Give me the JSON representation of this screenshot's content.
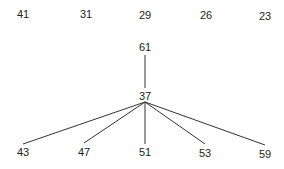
{
  "top_row": [
    {
      "label": "41",
      "x": 23,
      "y": 14
    },
    {
      "label": "31",
      "x": 86,
      "y": 14
    },
    {
      "label": "29",
      "x": 145,
      "y": 15
    },
    {
      "label": "26",
      "x": 206,
      "y": 15
    },
    {
      "label": "23",
      "x": 265,
      "y": 16
    }
  ],
  "tree": {
    "root": {
      "label": "61",
      "x": 145,
      "y": 47
    },
    "middle": {
      "label": "37",
      "x": 145,
      "y": 96
    },
    "children": [
      {
        "label": "43",
        "x": 23,
        "y": 152
      },
      {
        "label": "47",
        "x": 84,
        "y": 152
      },
      {
        "label": "51",
        "x": 145,
        "y": 152
      },
      {
        "label": "53",
        "x": 205,
        "y": 153
      },
      {
        "label": "59",
        "x": 265,
        "y": 154
      }
    ]
  },
  "colors": {
    "line": "#333333",
    "text": "#222222"
  }
}
